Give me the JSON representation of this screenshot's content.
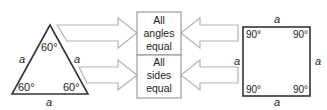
{
  "triangle": {
    "side_label": "a",
    "angles": [
      "60°",
      "60°",
      "60°"
    ]
  },
  "square": {
    "side_label": "a",
    "angles": [
      "90°",
      "90°",
      "90°",
      "90°"
    ]
  },
  "boxes": [
    {
      "lines": [
        "All",
        "angles",
        "equal"
      ]
    },
    {
      "lines": [
        "All",
        "sides",
        "equal"
      ]
    }
  ],
  "colors": {
    "shape_stroke": "#333333",
    "box_stroke": "#999999",
    "arrow_stroke": "#b0b0b0"
  }
}
